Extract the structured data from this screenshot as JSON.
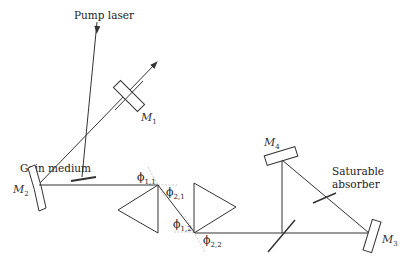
{
  "diagram": {
    "labels": {
      "pump_laser": "Pump laser",
      "gain_medium": "Gain medium",
      "saturable_absorber_line1": "Saturable",
      "saturable_absorber_line2": "absorber"
    },
    "mirrors": [
      {
        "id": "M1",
        "base": "M",
        "sub": "1"
      },
      {
        "id": "M2",
        "base": "M",
        "sub": "2"
      },
      {
        "id": "M3",
        "base": "M",
        "sub": "3"
      },
      {
        "id": "M4",
        "base": "M",
        "sub": "4"
      }
    ],
    "angles": [
      {
        "id": "phi11",
        "base": "ϕ",
        "sub": "1,1"
      },
      {
        "id": "phi21",
        "base": "ϕ",
        "sub": "2,1"
      },
      {
        "id": "phi12",
        "base": "ϕ",
        "sub": "1,2"
      },
      {
        "id": "phi22",
        "base": "ϕ",
        "sub": "2,2"
      }
    ],
    "colors": {
      "line": "#333333",
      "guide": "#bbbbbb",
      "background": "#ffffff"
    }
  }
}
